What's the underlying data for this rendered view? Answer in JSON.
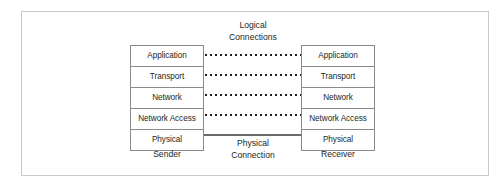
{
  "figure": {
    "background_color": "#ffffff",
    "frame_color": "#c9c9c9",
    "box_border_color": "#8a8a8a",
    "text_color": "#231f20",
    "dotted_line_color": "#231f20",
    "solid_line_color": "#6b6b6b"
  },
  "layers": [
    {
      "name": "Application"
    },
    {
      "name": "Transport"
    },
    {
      "name": "Network"
    },
    {
      "name": "Network Access"
    },
    {
      "name": "Physical"
    }
  ],
  "sender": {
    "caption": "Sender",
    "layers": [
      {
        "label": "Application"
      },
      {
        "label": "Transport"
      },
      {
        "label": "Network"
      },
      {
        "label": "Network Access"
      },
      {
        "label": "Physical"
      }
    ]
  },
  "receiver": {
    "caption": "Receiver",
    "layers": [
      {
        "label": "Application"
      },
      {
        "label": "Transport"
      },
      {
        "label": "Network"
      },
      {
        "label": "Network Access"
      },
      {
        "label": "Physical"
      }
    ]
  },
  "connections": {
    "logical": {
      "caption_line1": "Logical",
      "caption_line2": "Connections",
      "style": "dotted",
      "count": 4,
      "connects_layers": [
        "Application",
        "Transport",
        "Network",
        "Network Access"
      ]
    },
    "physical": {
      "caption_line1": "Physical",
      "caption_line2": "Connection",
      "style": "solid",
      "count": 1,
      "connects_layers": [
        "Physical"
      ]
    }
  }
}
